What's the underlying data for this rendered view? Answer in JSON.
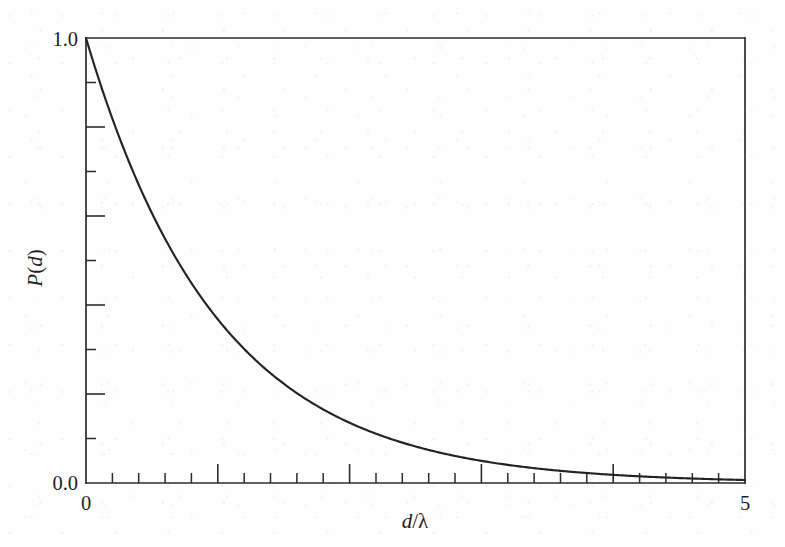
{
  "figure": {
    "background_color": "#fefefe",
    "ink_color": "#232323",
    "axis_color": "#2b2b2b"
  },
  "labels": {
    "y_top": "1.0",
    "y_bottom": "0.0",
    "x_left": "0",
    "x_right": "5",
    "y_axis_title_parts": {
      "p": "P",
      "open": "(",
      "d": "d",
      "close": ")"
    },
    "x_axis_title_parts": {
      "d": "d",
      "slash": "/",
      "lambda": "λ"
    },
    "y_axis_title": "P(d)",
    "x_axis_title": "d/λ"
  },
  "chart_data": {
    "type": "line",
    "title": "",
    "subtitle": "",
    "xlabel": "d/λ",
    "ylabel": "P(d)",
    "xlim": [
      0,
      5
    ],
    "ylim": [
      0,
      1
    ],
    "grid": false,
    "legend": null,
    "x_tick_labels": [
      "0",
      "5"
    ],
    "y_tick_labels": [
      "0.0",
      "1.0"
    ],
    "x_major_ticks": [
      0,
      1,
      2,
      3,
      4,
      5
    ],
    "x_minor_ticks": [
      0.2,
      0.4,
      0.6,
      0.8,
      1.2,
      1.4,
      1.6,
      1.8,
      2.2,
      2.4,
      2.6,
      2.8,
      3.2,
      3.4,
      3.6,
      3.8,
      4.2,
      4.4,
      4.6,
      4.8
    ],
    "y_major_ticks": [
      0.2,
      0.4,
      0.6,
      0.8
    ],
    "y_minor_ticks": [
      0.1,
      0.3,
      0.5,
      0.7,
      0.9
    ],
    "function": "P(d) = exp(-d/lambda)",
    "series": [
      {
        "name": "P(d) = exp(-d/λ)",
        "x": [
          0,
          0.1,
          0.2,
          0.3,
          0.4,
          0.5,
          0.6,
          0.7,
          0.8,
          0.9,
          1.0,
          1.2,
          1.4,
          1.6,
          1.8,
          2.0,
          2.2,
          2.4,
          2.6,
          2.8,
          3.0,
          3.2,
          3.4,
          3.6,
          3.8,
          4.0,
          4.2,
          4.4,
          4.6,
          4.8,
          5.0
        ],
        "values": [
          1.0,
          0.905,
          0.819,
          0.741,
          0.67,
          0.607,
          0.549,
          0.497,
          0.449,
          0.407,
          0.368,
          0.301,
          0.247,
          0.202,
          0.165,
          0.135,
          0.111,
          0.091,
          0.074,
          0.061,
          0.05,
          0.041,
          0.033,
          0.027,
          0.022,
          0.018,
          0.015,
          0.012,
          0.01,
          0.008,
          0.007
        ]
      }
    ]
  }
}
